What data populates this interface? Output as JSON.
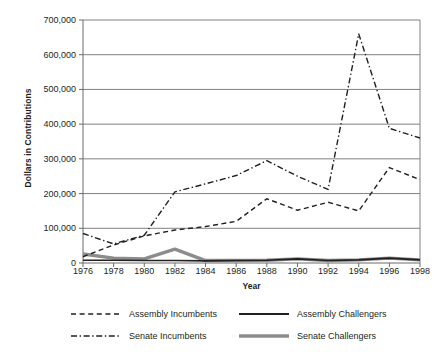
{
  "chart_data": {
    "type": "line",
    "title": "",
    "xlabel": "Year",
    "ylabel": "Dollars in Contributions",
    "x": [
      1976,
      1978,
      1980,
      1982,
      1984,
      1986,
      1988,
      1990,
      1992,
      1994,
      1996,
      1998
    ],
    "categories": [
      "1976",
      "1978",
      "1980",
      "1982",
      "1984",
      "1986",
      "1988",
      "1990",
      "1992",
      "1994",
      "1996",
      "1998"
    ],
    "xlim": [
      1976,
      1998
    ],
    "ylim": [
      0,
      700000
    ],
    "yticks": [
      0,
      100000,
      200000,
      300000,
      400000,
      500000,
      600000,
      700000
    ],
    "ytick_labels": [
      "0",
      "100,000",
      "200,000",
      "300,000",
      "400,000",
      "500,000",
      "600,000",
      "700,000"
    ],
    "grid": "horizontal",
    "legend_position": "below",
    "series": [
      {
        "name": "Assembly Incumbents",
        "style": "dashed",
        "color": "#231f20",
        "width": 1.4,
        "values": [
          18000,
          52000,
          78000,
          95000,
          105000,
          120000,
          185000,
          152000,
          175000,
          150000,
          275000,
          240000
        ]
      },
      {
        "name": "Senate Incumbents",
        "style": "dash-dot",
        "color": "#231f20",
        "width": 1.4,
        "values": [
          85000,
          55000,
          80000,
          205000,
          228000,
          252000,
          295000,
          250000,
          212000,
          660000,
          388000,
          360000
        ]
      },
      {
        "name": "Assembly Challengers",
        "style": "solid",
        "color": "#231f20",
        "width": 1.6,
        "values": [
          8000,
          8000,
          7000,
          7000,
          6000,
          7000,
          8000,
          12000,
          7000,
          9000,
          14000,
          9000
        ]
      },
      {
        "name": "Senate Challengers",
        "style": "solid",
        "color": "#8c8c8c",
        "width": 3.4,
        "values": [
          26000,
          14000,
          12000,
          40000,
          7000,
          7000,
          8000,
          12000,
          7000,
          9000,
          14000,
          9000
        ]
      }
    ]
  },
  "legend": {
    "items": [
      {
        "label": "Assembly Incumbents",
        "swatch": "dashed-line-swatch"
      },
      {
        "label": "Assembly Challengers",
        "swatch": "solid-thin-line-swatch"
      },
      {
        "label": "Senate Incumbents",
        "swatch": "dash-dot-line-swatch"
      },
      {
        "label": "Senate Challengers",
        "swatch": "solid-thick-gray-line-swatch"
      }
    ]
  },
  "colors": {
    "ink": "#231f20",
    "grid": "#808080",
    "axis": "#6b6b6b",
    "gray_series": "#8c8c8c",
    "background": "#ffffff"
  }
}
